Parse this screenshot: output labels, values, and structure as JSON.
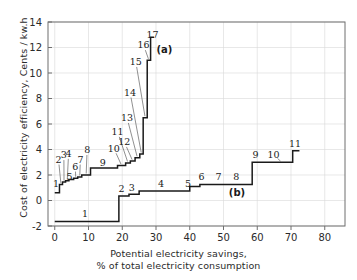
{
  "figure": {
    "ylabel": "Cost of electricity efficiency, Cents / kw.h",
    "xlabel_line1": "Potential electricity savings,",
    "xlabel_line2": "% of total electricity consumption",
    "curve_a_annotation": "(a)",
    "curve_b_annotation": "(b)",
    "line_color": "#1a1a1a",
    "axis_color": "#6f6f6f",
    "grid_color": "#d9d9d9"
  },
  "chart_data": {
    "type": "line",
    "title": "",
    "xlabel": "Potential electricity savings, % of total electricity consumption",
    "ylabel": "Cost of electricity efficiency, Cents / kw.h",
    "xlim": [
      -2,
      86
    ],
    "ylim": [
      -2,
      14
    ],
    "xticks": [
      0,
      10,
      20,
      30,
      40,
      50,
      60,
      70,
      80
    ],
    "yticks": [
      -2,
      0,
      2,
      4,
      6,
      8,
      10,
      12,
      14
    ],
    "grid": true,
    "legend_position": "inline-annotations",
    "series": [
      {
        "name": "(a)",
        "label": "(a)",
        "annotation_xy": [
          32.5,
          11.6
        ],
        "step_type": "post",
        "steps": [
          {
            "n": 1,
            "x_start": 0.0,
            "x_end": 1.4,
            "y": 0.6,
            "label_xy": [
              0.4,
              1.35
            ]
          },
          {
            "n": 2,
            "x_start": 1.4,
            "x_end": 2.3,
            "y": 1.25,
            "label_xy": [
              1.1,
              3.25
            ]
          },
          {
            "n": 3,
            "x_start": 2.3,
            "x_end": 3.2,
            "y": 1.45,
            "label_xy": [
              2.7,
              3.6
            ]
          },
          {
            "n": 4,
            "x_start": 3.2,
            "x_end": 4.2,
            "y": 1.55,
            "label_xy": [
              4.1,
              3.7
            ]
          },
          {
            "n": 5,
            "x_start": 4.2,
            "x_end": 5.6,
            "y": 1.65,
            "label_xy": [
              4.4,
              1.85
            ]
          },
          {
            "n": 6,
            "x_start": 5.6,
            "x_end": 6.8,
            "y": 1.75,
            "label_xy": [
              6.1,
              2.7
            ]
          },
          {
            "n": 7,
            "x_start": 6.8,
            "x_end": 8.0,
            "y": 1.85,
            "label_xy": [
              7.6,
              3.25
            ]
          },
          {
            "n": 8,
            "x_start": 8.0,
            "x_end": 10.6,
            "y": 2.0,
            "label_xy": [
              9.6,
              4.0
            ]
          },
          {
            "n": 9,
            "x_start": 10.6,
            "x_end": 18.6,
            "y": 2.55,
            "label_xy": [
              14.2,
              3.0
            ]
          },
          {
            "n": 10,
            "x_start": 18.6,
            "x_end": 21.0,
            "y": 2.75,
            "label_xy": [
              17.5,
              4.1
            ]
          },
          {
            "n": 11,
            "x_start": 21.0,
            "x_end": 22.4,
            "y": 2.95,
            "label_xy": [
              18.6,
              5.4
            ]
          },
          {
            "n": 12,
            "x_start": 22.4,
            "x_end": 23.8,
            "y": 3.1,
            "label_xy": [
              20.6,
              4.6
            ]
          },
          {
            "n": 13,
            "x_start": 23.8,
            "x_end": 25.2,
            "y": 3.35,
            "label_xy": [
              21.4,
              6.5
            ]
          },
          {
            "n": 14,
            "x_start": 25.2,
            "x_end": 26.2,
            "y": 3.65,
            "label_xy": [
              22.3,
              8.5
            ]
          },
          {
            "n": 15,
            "x_start": 26.2,
            "x_end": 27.4,
            "y": 6.5,
            "label_xy": [
              24.0,
              10.9
            ]
          },
          {
            "n": 16,
            "x_start": 27.4,
            "x_end": 28.4,
            "y": 11.0,
            "label_xy": [
              26.3,
              12.2
            ]
          },
          {
            "n": 17,
            "x_start": 28.4,
            "x_end": 29.4,
            "y": 12.8,
            "label_xy": [
              29.0,
              13.0
            ]
          }
        ]
      },
      {
        "name": "(b)",
        "label": "(b)",
        "annotation_xy": [
          54.0,
          0.35
        ],
        "step_type": "post",
        "steps": [
          {
            "n": 1,
            "x_start": 0.0,
            "x_end": 19.0,
            "y": -1.65,
            "label_xy": [
              9.0,
              -1.0
            ]
          },
          {
            "n": 2,
            "x_start": 19.0,
            "x_end": 22.0,
            "y": 0.35,
            "label_xy": [
              19.8,
              0.95
            ]
          },
          {
            "n": 3,
            "x_start": 22.0,
            "x_end": 25.0,
            "y": 0.5,
            "label_xy": [
              22.8,
              1.05
            ]
          },
          {
            "n": 4,
            "x_start": 25.0,
            "x_end": 40.0,
            "y": 0.75,
            "label_xy": [
              31.5,
              1.3
            ]
          },
          {
            "n": 5,
            "x_start": 40.0,
            "x_end": 43.0,
            "y": 1.1,
            "label_xy": [
              39.5,
              1.3
            ]
          },
          {
            "n": 6,
            "x_start": 43.0,
            "x_end": 48.0,
            "y": 1.25,
            "label_xy": [
              43.5,
              1.9
            ]
          },
          {
            "n": 7,
            "x_start": 48.0,
            "x_end": 53.0,
            "y": 1.25,
            "label_xy": [
              48.5,
              1.9
            ]
          },
          {
            "n": 8,
            "x_start": 53.0,
            "x_end": 58.5,
            "y": 1.25,
            "label_xy": [
              53.8,
              1.9
            ]
          },
          {
            "n": 9,
            "x_start": 58.5,
            "x_end": 64.0,
            "y": 3.0,
            "label_xy": [
              59.5,
              3.6
            ]
          },
          {
            "n": 10,
            "x_start": 64.0,
            "x_end": 70.5,
            "y": 3.0,
            "label_xy": [
              64.8,
              3.6
            ]
          },
          {
            "n": 11,
            "x_start": 70.5,
            "x_end": 72.5,
            "y": 3.9,
            "label_xy": [
              71.2,
              4.5
            ]
          }
        ]
      }
    ]
  }
}
